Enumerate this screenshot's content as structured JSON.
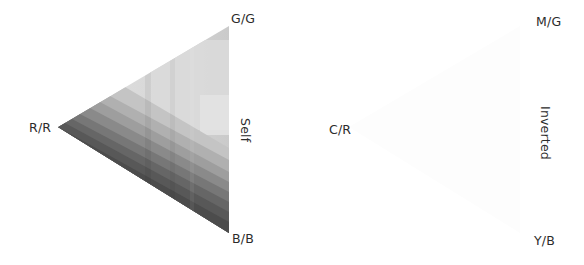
{
  "figure": {
    "panels": [
      {
        "id": "self",
        "title": "Self",
        "vertex_labels": {
          "top": "G/G",
          "left": "R/R",
          "bottom": "B/B"
        }
      },
      {
        "id": "inverted",
        "title": "Inverted",
        "vertex_labels": {
          "top": "M/G",
          "left": "C/R",
          "bottom": "Y/B"
        }
      }
    ],
    "colors": {
      "background": "#ffffff",
      "text": "#2b2b2b",
      "inverted_fill": "#fdfdfd"
    },
    "self_bands": [
      {
        "shade": "#c9c9c9"
      },
      {
        "shade": "#d4d4d4"
      },
      {
        "shade": "#dcdcdc"
      },
      {
        "shade": "#c2c2c2"
      },
      {
        "shade": "#b3b3b3"
      },
      {
        "shade": "#a3a3a3"
      },
      {
        "shade": "#8e8e8e"
      },
      {
        "shade": "#7a7a7a"
      },
      {
        "shade": "#676767"
      },
      {
        "shade": "#575757"
      },
      {
        "shade": "#4b4b4b"
      }
    ]
  }
}
